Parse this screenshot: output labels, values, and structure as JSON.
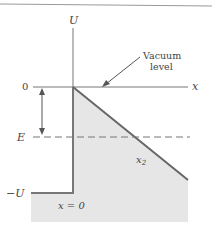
{
  "diagram": {
    "axis_labels": {
      "vertical": "U",
      "horizontal": "x"
    },
    "level_labels": {
      "zero": "0",
      "energy": "E",
      "neg_u": "−U"
    },
    "annotations": {
      "vacuum_line1": "Vacuum",
      "vacuum_line2": "level",
      "x2_base": "x",
      "x2_sub": "2",
      "x_zero": "x = 0"
    },
    "colors": {
      "line": "#666666",
      "fill": "#e6e6e6",
      "text": "#444444",
      "border": "#999999"
    }
  }
}
